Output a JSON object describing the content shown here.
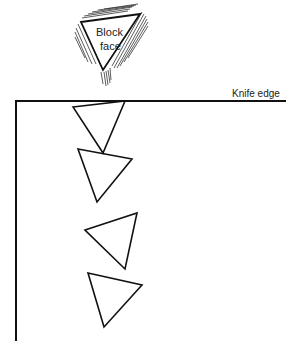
{
  "diagram": {
    "labels": {
      "block_face_line1": "Block",
      "block_face_line2": "face",
      "knife_edge": "Knife edge"
    },
    "colors": {
      "stroke": "#111111",
      "hatch": "#333333",
      "background": "#ffffff"
    },
    "block_face": {
      "shape": "inverted-triangle",
      "vertices": [
        [
          81,
          22
        ],
        [
          140,
          14
        ],
        [
          103,
          70
        ]
      ],
      "hatched": true
    },
    "knife_edge": {
      "horizontal_line": {
        "x1": 16,
        "y1": 101,
        "x2": 285,
        "y2": 101
      },
      "vertical_line": {
        "x1": 16,
        "y1": 101,
        "x2": 16,
        "y2": 340
      }
    },
    "sections": [
      {
        "id": 1,
        "vertices": [
          [
            73,
            107
          ],
          [
            125,
            101
          ],
          [
            103,
            153
          ]
        ]
      },
      {
        "id": 2,
        "vertices": [
          [
            78,
            149
          ],
          [
            132,
            159
          ],
          [
            97,
            202
          ]
        ]
      },
      {
        "id": 3,
        "vertices": [
          [
            85,
            230
          ],
          [
            137,
            213
          ],
          [
            125,
            269
          ]
        ]
      },
      {
        "id": 4,
        "vertices": [
          [
            88,
            273
          ],
          [
            142,
            285
          ],
          [
            104,
            327
          ]
        ]
      }
    ]
  }
}
